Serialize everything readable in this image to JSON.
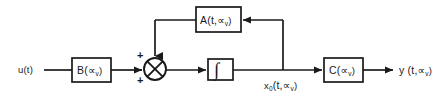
{
  "diagram": {
    "type": "control-block-diagram",
    "background_color": "#ffffff",
    "line_color": "#1a1a1a",
    "text_color": "#1a1a1a",
    "input_label": "u(t)",
    "output_label": "y (t,∝",
    "output_label_sub": "v",
    "output_label_tail": ")",
    "state_label": "x",
    "state_label_sub": "0",
    "state_label_tail": "(t,∝",
    "state_label_sub2": "v",
    "state_label_tail2": ")",
    "sum_plus_top": "+",
    "sum_plus_bottom": "+",
    "integrator_glyph": "∫",
    "blocks": [
      {
        "name": "input-gain-block",
        "label_main": "B(∝",
        "label_sub": "v",
        "label_tail": ")",
        "x": 72,
        "y": 58,
        "w": 39,
        "h": 24
      },
      {
        "name": "integrator-block",
        "label_main": "∫",
        "label_sub": "",
        "label_tail": "",
        "x": 208,
        "y": 59,
        "w": 25,
        "h": 21
      },
      {
        "name": "system-matrix-block",
        "label_main": "A(t,∝",
        "label_sub": "v",
        "label_tail": ")",
        "x": 196,
        "y": 7,
        "w": 45,
        "h": 25
      },
      {
        "name": "output-gain-block",
        "label_main": "C(∝",
        "label_sub": "v",
        "label_tail": ")",
        "x": 324,
        "y": 58,
        "w": 39,
        "h": 24
      }
    ],
    "summing_junction": {
      "name": "summing-junction",
      "cx": 155,
      "cy": 69,
      "r": 11,
      "symbol": "⊗"
    }
  }
}
